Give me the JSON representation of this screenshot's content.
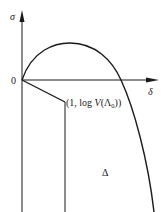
{
  "diagram": {
    "axes": {
      "y_label": "σ",
      "x_label": "δ",
      "origin_label": "0"
    },
    "point_label": {
      "prefix": "(1, log ",
      "func": "V",
      "open": "(",
      "symbol": "Λ",
      "subscript": "0",
      "close": "))"
    },
    "region_label": "Δ",
    "colors": {
      "stroke": "#1a1a1a",
      "background": "#ffffff"
    }
  }
}
